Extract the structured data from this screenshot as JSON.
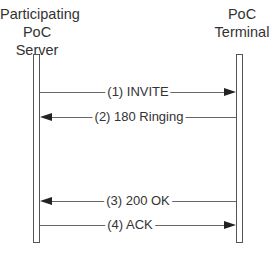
{
  "entities": [
    {
      "id": "server",
      "lines": [
        "Participating",
        "PoC Server"
      ]
    },
    {
      "id": "terminal",
      "lines": [
        "PoC",
        "Terminal"
      ]
    }
  ],
  "messages": [
    {
      "label": "(1) INVITE",
      "from": "server",
      "to": "terminal"
    },
    {
      "label": "(2) 180 Ringing",
      "from": "terminal",
      "to": "server"
    },
    {
      "label": "(3) 200 OK",
      "from": "terminal",
      "to": "server"
    },
    {
      "label": "(4) ACK",
      "from": "server",
      "to": "terminal"
    }
  ]
}
